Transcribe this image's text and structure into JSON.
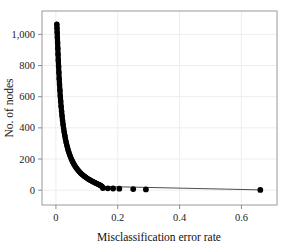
{
  "chart_data": {
    "type": "scatter",
    "title": "",
    "xlabel": "Misclassification error rate",
    "ylabel": "No. of nodes",
    "xlim": [
      -0.045,
      0.715
    ],
    "ylim": [
      -95,
      1150
    ],
    "xticks": [
      0,
      0.2,
      0.4,
      0.6
    ],
    "xtick_labels": [
      "0",
      "0.2",
      "0.4",
      "0.6"
    ],
    "yticks": [
      0,
      200,
      400,
      600,
      800,
      1000
    ],
    "ytick_labels": [
      "0",
      "200",
      "400",
      "600",
      "800",
      "1,000"
    ],
    "grid": true,
    "legend": false,
    "marker": "filled-circle",
    "marker_color": "#000000",
    "grid_color": "#ededed",
    "frame_color": "#9a9a9a",
    "background_color": "#ffffff",
    "series": [
      {
        "name": "pruning path",
        "x": [
          0.003,
          0.0035,
          0.0041,
          0.0047,
          0.0054,
          0.0061,
          0.0069,
          0.0077,
          0.0086,
          0.0096,
          0.0106,
          0.0117,
          0.0129,
          0.0141,
          0.0154,
          0.0168,
          0.0183,
          0.0198,
          0.0214,
          0.0231,
          0.0249,
          0.0268,
          0.0287,
          0.0307,
          0.0328,
          0.035,
          0.0373,
          0.0396,
          0.042,
          0.0445,
          0.0471,
          0.0498,
          0.0525,
          0.0553,
          0.0582,
          0.0612,
          0.0642,
          0.0673,
          0.0705,
          0.0737,
          0.077,
          0.0804,
          0.0838,
          0.0872,
          0.0907,
          0.0942,
          0.0978,
          0.1014,
          0.105,
          0.1086,
          0.1122,
          0.1158,
          0.1193,
          0.1228,
          0.1262,
          0.1295,
          0.1327,
          0.1358,
          0.1388,
          0.1416,
          0.1443,
          0.1468,
          0.1491
        ],
        "y": [
          1065,
          1040,
          1012,
          980,
          946,
          910,
          872,
          834,
          795,
          755,
          716,
          678,
          641,
          605,
          571,
          538,
          507,
          477,
          449,
          422,
          397,
          373,
          351,
          330,
          310,
          291,
          274,
          257,
          242,
          227,
          214,
          201,
          189,
          178,
          167,
          157,
          148,
          139,
          131,
          123,
          116,
          109,
          103,
          97,
          91,
          86,
          81,
          76,
          71,
          67,
          63,
          59,
          55,
          52,
          48,
          45,
          42,
          39,
          36,
          33,
          30,
          27,
          24
        ],
        "tail_x": [
          0.152,
          0.168,
          0.185,
          0.205,
          0.25,
          0.291,
          0.661
        ],
        "tail_y": [
          14,
          12,
          11,
          10,
          7,
          5,
          2
        ]
      }
    ]
  },
  "axes": {
    "ylabel": "No. of nodes",
    "xlabel": "Misclassification error rate"
  }
}
